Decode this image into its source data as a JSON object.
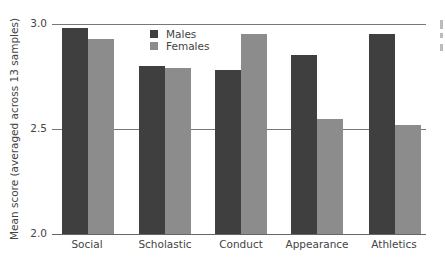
{
  "chart_data": {
    "type": "bar",
    "title": "",
    "xlabel": "",
    "ylabel": "Mean score (averaged across 13 samples)",
    "ylim": [
      2.0,
      3.0
    ],
    "yticks": [
      "2.0",
      "2.5",
      "3.0"
    ],
    "gridlines": [
      2.5,
      3.0
    ],
    "legend_position": "top-left inside",
    "categories": [
      "Social",
      "Scholastic",
      "Conduct",
      "Appearance",
      "Athletics"
    ],
    "series": [
      {
        "name": "Males",
        "color": "#3f3f3f",
        "values": [
          2.98,
          2.8,
          2.78,
          2.85,
          2.95
        ]
      },
      {
        "name": "Females",
        "color": "#8c8c8c",
        "values": [
          2.93,
          2.79,
          2.95,
          2.55,
          2.52
        ]
      }
    ]
  }
}
